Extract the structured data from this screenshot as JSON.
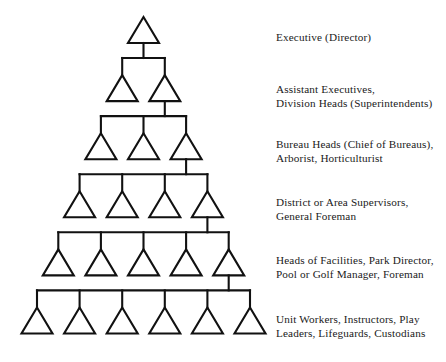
{
  "diagram": {
    "type": "organizational-pyramid",
    "title": "",
    "shape": "triangle",
    "colors": {
      "stroke": "#111111",
      "fill": "#ffffff",
      "text": "#1a1a1a",
      "background": "#ffffff"
    },
    "levels": [
      {
        "index": 1,
        "units": 1,
        "label_lines": [
          "Executive (Director)"
        ],
        "label": "Executive (Director)"
      },
      {
        "index": 2,
        "units": 2,
        "label_lines": [
          "Assistant Executives,",
          "Division Heads (Superintendents)"
        ],
        "label": "Assistant Executives, Division Heads (Superintendents)"
      },
      {
        "index": 3,
        "units": 3,
        "label_lines": [
          "Bureau Heads (Chief of Bureaus),",
          "Arborist, Horticulturist"
        ],
        "label": "Bureau Heads (Chief of Bureaus), Arborist, Horticulturist"
      },
      {
        "index": 4,
        "units": 4,
        "label_lines": [
          "District or Area Supervisors,",
          "General Foreman"
        ],
        "label": "District or Area Supervisors, General Foreman"
      },
      {
        "index": 5,
        "units": 5,
        "label_lines": [
          "Heads of Facilities, Park Director,",
          "Pool or Golf Manager, Foreman"
        ],
        "label": "Heads of Facilities, Park Director, Pool or Golf Manager, Foreman"
      },
      {
        "index": 6,
        "units": 6,
        "label_lines": [
          "Unit Workers, Instructors, Play",
          "Leaders, Lifeguards, Custodians"
        ],
        "label": "Unit Workers, Instructors, Play Leaders, Lifeguards, Custodians"
      }
    ]
  }
}
